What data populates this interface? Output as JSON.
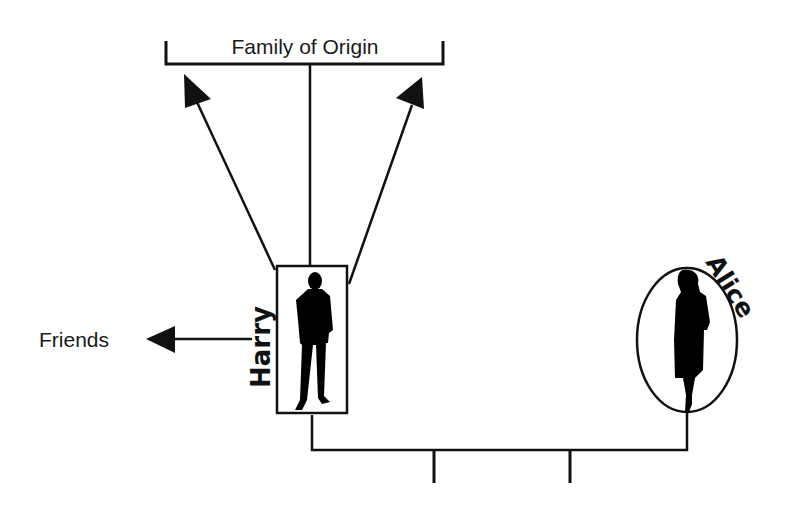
{
  "diagram": {
    "type": "family-relationship-diagram",
    "family_of_origin": {
      "label": "Family of Origin"
    },
    "friends": {
      "label": "Friends"
    },
    "people": [
      {
        "name": "Harry",
        "shape": "rectangle",
        "figure": "man-silhouette"
      },
      {
        "name": "Alice",
        "shape": "ellipse",
        "figure": "woman-silhouette"
      }
    ],
    "relationships": [
      {
        "from": "Harry",
        "to": "Family of Origin",
        "kind": "arrows",
        "count": 2
      },
      {
        "from": "Harry",
        "to": "Family of Origin",
        "kind": "line"
      },
      {
        "from": "Harry",
        "to": "Friends",
        "kind": "arrow"
      },
      {
        "from": "Harry",
        "to": "Alice",
        "kind": "marriage-line",
        "children_lines": 2
      }
    ],
    "colors": {
      "ink": "#111111",
      "background": "#ffffff"
    }
  }
}
